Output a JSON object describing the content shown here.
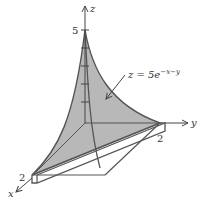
{
  "figure": {
    "type": "3d-surface-plot",
    "surface_equation": {
      "prefix": "z = 5e",
      "exponent": "−x−y"
    },
    "axes": {
      "x": {
        "label": "x",
        "tick": "2"
      },
      "y": {
        "label": "y",
        "tick": "2"
      },
      "z": {
        "label": "z",
        "tick": "5"
      }
    },
    "colors": {
      "surface_fill": "#b8b8b8",
      "edge": "#555555",
      "axis": "#444444",
      "slab_fill": "#ffffff"
    }
  }
}
